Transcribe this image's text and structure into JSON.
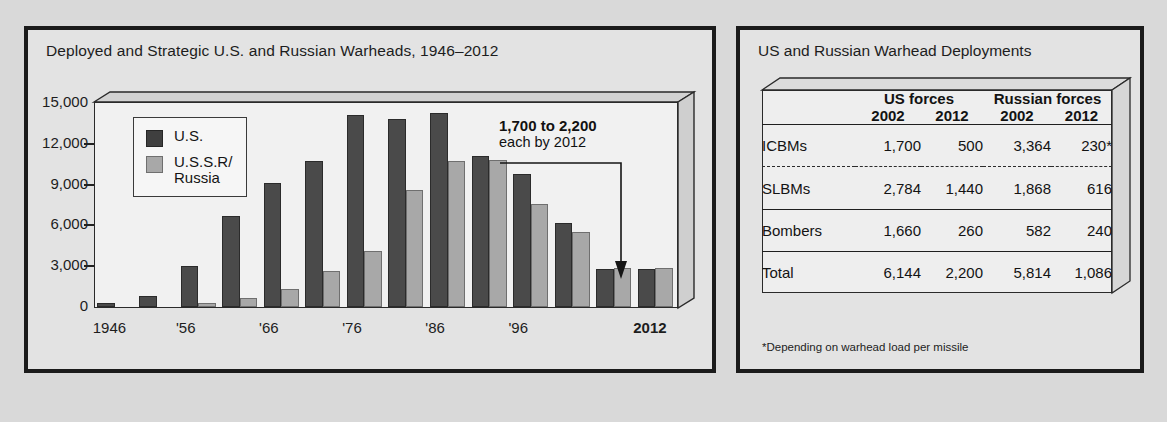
{
  "chart_panel": {
    "title": "Deployed and Strategic U.S. and Russian Warheads, 1946–2012",
    "legend": {
      "us": "U.S.",
      "ussr": "U.S.S.R/\nRussia"
    },
    "annotation": {
      "line1": "1,700 to 2,200",
      "line2": "each by 2012"
    }
  },
  "table_panel": {
    "title": "US and Russian Warhead Deployments",
    "group_headers": [
      "",
      "US forces",
      "Russian forces"
    ],
    "year_headers": [
      "",
      "2002",
      "2012",
      "2002",
      "2012"
    ],
    "rows": [
      {
        "label": "ICBMs",
        "values": [
          "1,700",
          "500",
          "3,364",
          "230*"
        ]
      },
      {
        "label": "SLBMs",
        "values": [
          "2,784",
          "1,440",
          "1,868",
          "616"
        ]
      },
      {
        "label": "Bombers",
        "values": [
          "1,660",
          "260",
          "582",
          "240"
        ]
      },
      {
        "label": "Total",
        "values": [
          "6,144",
          "2,200",
          "5,814",
          "1,086"
        ]
      }
    ],
    "footnote": "*Depending on warhead load per missile"
  },
  "chart_data": {
    "type": "bar",
    "title": "Deployed and Strategic U.S. and Russian Warheads, 1946–2012",
    "xlabel": "",
    "ylabel": "",
    "ylim": [
      0,
      15000
    ],
    "yticks": [
      0,
      3000,
      6000,
      9000,
      12000,
      15000
    ],
    "ytick_labels": [
      "0",
      "3,000",
      "6,000",
      "9,000",
      "12,000",
      "15,000"
    ],
    "grid": false,
    "legend_position": "upper-left",
    "categories": [
      1946,
      1951,
      1956,
      1961,
      1966,
      1971,
      1976,
      1981,
      1986,
      1991,
      1996,
      2001,
      2006,
      2012
    ],
    "xtick_labels": [
      "1946",
      "'56",
      "'66",
      "'76",
      "'86",
      "'96",
      "2012"
    ],
    "xtick_categories": [
      1946,
      1956,
      1966,
      1976,
      1986,
      1996,
      2012
    ],
    "series": [
      {
        "name": "U.S.",
        "color": "#4a4a4a",
        "values": [
          300,
          800,
          3000,
          6700,
          9100,
          10700,
          14100,
          13800,
          14300,
          11100,
          9800,
          6200,
          2800,
          2800
        ]
      },
      {
        "name": "U.S.S.R/Russia",
        "color": "#a8a8a8",
        "values": [
          0,
          0,
          300,
          650,
          1300,
          2650,
          4150,
          8600,
          10700,
          10800,
          7600,
          5500,
          2850,
          2850
        ]
      }
    ],
    "annotations": [
      {
        "text": "1,700 to 2,200 each by 2012",
        "points_to": 2012
      }
    ]
  }
}
